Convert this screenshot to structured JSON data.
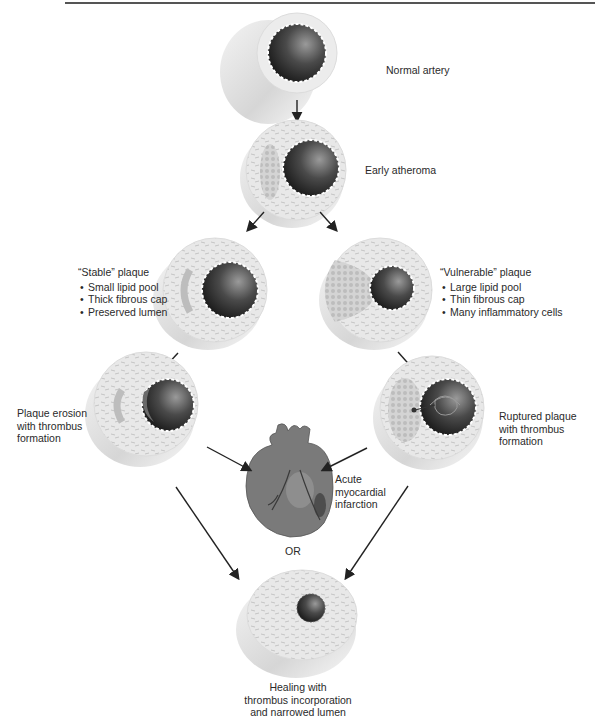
{
  "stages": {
    "normal": {
      "label": "Normal artery"
    },
    "early": {
      "label": "Early atheroma"
    },
    "stable": {
      "title": "“Stable” plaque",
      "bullets": [
        "Small lipid pool",
        "Thick fibrous cap",
        "Preserved lumen"
      ]
    },
    "vulnerable": {
      "title": "“Vulnerable” plaque",
      "bullets": [
        "Large lipid pool",
        "Thin fibrous cap",
        "Many inflammatory cells"
      ]
    },
    "erosion": {
      "lines": [
        "Plaque erosion",
        "with thrombus",
        "formation"
      ]
    },
    "ruptured": {
      "lines": [
        "Ruptured plaque",
        "with thrombus",
        "formation"
      ]
    },
    "mi": {
      "lines": [
        "Acute",
        "myocardial",
        "infarction"
      ]
    },
    "or_label": "OR",
    "healing": {
      "lines": [
        "Healing with",
        "thrombus incorporation",
        "and narrowed lumen"
      ]
    }
  },
  "colors": {
    "vessel_wall": "#e6e6e6",
    "vessel_side": "#d2d2d2",
    "lumen_dark": "#222222",
    "lumen_light": "#8a8a8a",
    "lipid_pool": "#c8c8c8",
    "heart": "#7a7a7a",
    "arrow": "#222222",
    "text": "#2a2a2a"
  }
}
